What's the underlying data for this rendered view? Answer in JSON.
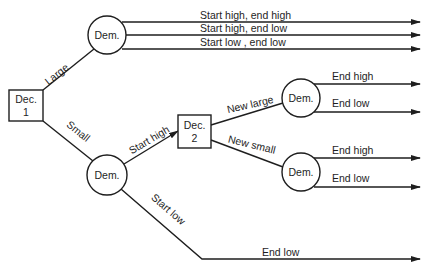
{
  "colors": {
    "line": "#1e1e1e",
    "background": "#ffffff"
  },
  "nodes": {
    "dec1": {
      "type": "decision",
      "line1": "Dec.",
      "line2": "1"
    },
    "dec2": {
      "type": "decision",
      "line1": "Dec.",
      "line2": "2"
    },
    "dem_top": {
      "type": "demand",
      "label": "Dem."
    },
    "dem_small": {
      "type": "demand",
      "label": "Dem."
    },
    "dem_new_large": {
      "type": "demand",
      "label": "Dem."
    },
    "dem_new_small": {
      "type": "demand",
      "label": "Dem."
    }
  },
  "edges": {
    "large": "Large",
    "small": "Small",
    "start_high": "Start high",
    "start_low": "Start low",
    "new_large": "New large",
    "new_small": "New small"
  },
  "outcomes": {
    "large_1": "Start high, end high",
    "large_2": "Start high, end low",
    "large_3": "Start low , end low",
    "new_large_1": "End high",
    "new_large_2": "End low",
    "new_small_1": "End high",
    "new_small_2": "End low",
    "start_low_1": "End low"
  }
}
